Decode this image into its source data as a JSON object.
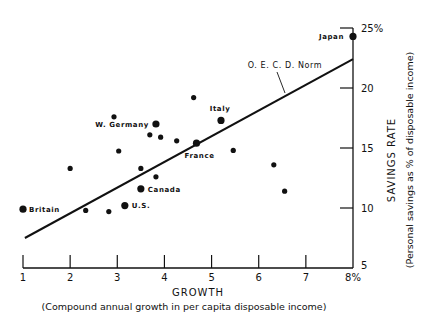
{
  "chart_data": {
    "type": "scatter",
    "title": "",
    "xlabel": "GROWTH",
    "xlabel_sub": "(Compound annual growth in per capita disposable income)",
    "ylabel": "SAVINGS RATE",
    "ylabel_sub": "(Personal savings as % of disposable income)",
    "xlim": [
      1,
      8
    ],
    "ylim": [
      5,
      25
    ],
    "x_ticks": [
      1,
      2,
      3,
      4,
      5,
      6,
      7,
      8
    ],
    "x_tick_labels": [
      "1",
      "2",
      "3",
      "4",
      "5",
      "6",
      "7",
      "8%"
    ],
    "y_ticks": [
      5,
      10,
      15,
      20,
      25
    ],
    "y_tick_labels": [
      "5",
      "10",
      "15",
      "20",
      "25%"
    ],
    "y_axis_position": "right",
    "grid": false,
    "legend": null,
    "points": [
      {
        "x": 1.0,
        "y": 9.9,
        "label": "Britain",
        "size": "large"
      },
      {
        "x": 2.0,
        "y": 13.3,
        "label": "",
        "size": "small"
      },
      {
        "x": 2.33,
        "y": 9.8,
        "label": "",
        "size": "small"
      },
      {
        "x": 2.82,
        "y": 9.7,
        "label": "",
        "size": "small"
      },
      {
        "x": 2.93,
        "y": 17.6,
        "label": "",
        "size": "small"
      },
      {
        "x": 3.03,
        "y": 14.75,
        "label": "",
        "size": "small"
      },
      {
        "x": 3.16,
        "y": 10.2,
        "label": "U.S.",
        "size": "large"
      },
      {
        "x": 3.5,
        "y": 13.3,
        "label": "",
        "size": "small"
      },
      {
        "x": 3.5,
        "y": 11.6,
        "label": "Canada",
        "size": "large"
      },
      {
        "x": 3.69,
        "y": 16.1,
        "label": "",
        "size": "small"
      },
      {
        "x": 3.82,
        "y": 17.0,
        "label": "W. Germany",
        "size": "large"
      },
      {
        "x": 3.82,
        "y": 12.6,
        "label": "",
        "size": "small"
      },
      {
        "x": 3.92,
        "y": 15.9,
        "label": "",
        "size": "small"
      },
      {
        "x": 4.26,
        "y": 15.6,
        "label": "",
        "size": "small"
      },
      {
        "x": 4.62,
        "y": 19.2,
        "label": "",
        "size": "small"
      },
      {
        "x": 4.68,
        "y": 15.4,
        "label": "France",
        "size": "large"
      },
      {
        "x": 5.2,
        "y": 17.3,
        "label": "Italy",
        "size": "large"
      },
      {
        "x": 5.46,
        "y": 14.8,
        "label": "",
        "size": "small"
      },
      {
        "x": 6.32,
        "y": 13.6,
        "label": "",
        "size": "small"
      },
      {
        "x": 6.55,
        "y": 11.4,
        "label": "",
        "size": "small"
      },
      {
        "x": 8.0,
        "y": 24.3,
        "label": "Japan",
        "size": "large"
      }
    ],
    "trend_line": {
      "label": "O.E.C.D. Norm",
      "from": {
        "x": 1.04,
        "y": 7.5
      },
      "to": {
        "x": 8.0,
        "y": 22.4
      }
    }
  },
  "labels": {
    "oecd": "O. E. C. D. Norm",
    "xlabel": "GROWTH",
    "xlabel_sub": "(Compound annual growth in per capita disposable income)",
    "ylabel": "SAVINGS RATE",
    "ylabel_sub": "(Personal savings as % of disposable income)"
  }
}
